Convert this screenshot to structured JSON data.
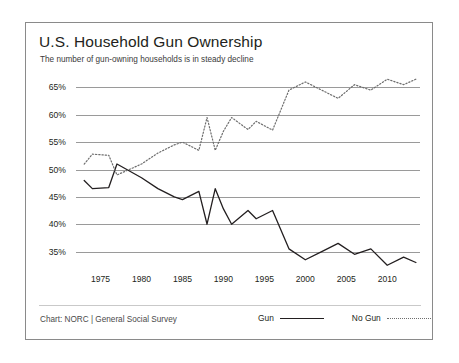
{
  "header": {
    "title": "U.S. Household Gun Ownership",
    "subtitle": "The number of gun-owning households is in steady decline"
  },
  "footer": {
    "credit": "Chart: NORC | General Social Survey"
  },
  "legend": {
    "gun_label": "Gun",
    "nogun_label": "No Gun"
  },
  "chart_data": {
    "type": "line",
    "title": "U.S. Household Gun Ownership",
    "subtitle": "The number of gun-owning households is in steady decline",
    "xlabel": "",
    "ylabel": "",
    "xlim": [
      1972,
      2014
    ],
    "ylim": [
      32,
      68
    ],
    "yticks": [
      35,
      40,
      45,
      50,
      55,
      60,
      65
    ],
    "ytick_labels": [
      "35%",
      "40%",
      "45%",
      "50%",
      "55%",
      "60%",
      "65%"
    ],
    "xticks": [
      1975,
      1980,
      1985,
      1990,
      1995,
      2000,
      2005,
      2010
    ],
    "xtick_labels": [
      "1975",
      "1980",
      "1985",
      "1990",
      "1995",
      "2000",
      "2005",
      "2010"
    ],
    "grid": true,
    "grid_axis": "y",
    "legend_position": "bottom-right",
    "colors": {
      "gun": "#231f20",
      "nogun": "#6e6e6e",
      "gridline": "#9a9a9a",
      "frame": "#8a8a8a"
    },
    "series": [
      {
        "name": "Gun",
        "style": "solid",
        "x": [
          1973,
          1974,
          1976,
          1977,
          1980,
          1982,
          1984,
          1985,
          1987,
          1988,
          1989,
          1990,
          1991,
          1993,
          1994,
          1996,
          1998,
          2000,
          2002,
          2004,
          2006,
          2008,
          2010,
          2012
        ],
        "values": [
          48.0,
          46.5,
          46.7,
          51.0,
          48.5,
          46.5,
          45.0,
          44.5,
          46.0,
          40.0,
          46.5,
          42.8,
          40.0,
          42.5,
          41.0,
          42.5,
          35.5,
          33.5,
          35.0,
          36.5,
          34.5,
          35.5,
          32.5,
          34.0
        ],
        "end_value": 33.0
      },
      {
        "name": "No Gun",
        "style": "dotted",
        "x": [
          1973,
          1974,
          1976,
          1977,
          1980,
          1982,
          1984,
          1985,
          1987,
          1988,
          1989,
          1990,
          1991,
          1993,
          1994,
          1996,
          1998,
          2000,
          2002,
          2004,
          2006,
          2008,
          2010,
          2012
        ],
        "values": [
          51.0,
          52.8,
          52.6,
          49.0,
          51.0,
          53.0,
          54.5,
          55.0,
          53.5,
          59.5,
          53.5,
          57.0,
          59.5,
          57.3,
          58.8,
          57.2,
          64.5,
          66.0,
          64.5,
          63.0,
          65.5,
          64.5,
          66.5,
          65.5
        ],
        "end_value": 66.5
      }
    ]
  }
}
